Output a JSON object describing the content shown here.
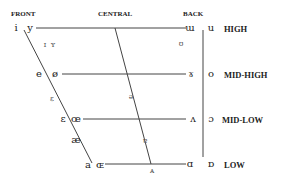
{
  "columns": {
    "front": "FRONT",
    "central": "CENTRAL",
    "back": "BACK"
  },
  "heights": {
    "high": "HIGH",
    "mid_high": "MID-HIGH",
    "mid_low": "MID-LOW",
    "low": "LOW"
  },
  "vowels": {
    "i": "i",
    "y": "y",
    "I": "ɪ",
    "Y": "ʏ",
    "uu": "ɯ",
    "u": "u",
    "upsilon": "ʊ",
    "e": "e",
    "oe": "ø",
    "schwa": "ə",
    "gamma": "ɤ",
    "o": "o",
    "E_small": "ɛ",
    "eps": "ɛ",
    "oe_lig": "œ",
    "turnedA": "ɐ",
    "wedge": "ʌ",
    "openo": "ɔ",
    "ae": "æ",
    "a": "a",
    "OE": "ɶ",
    "capA": "ᴀ",
    "alpha": "ɑ",
    "turnedalpha": "ɒ"
  }
}
